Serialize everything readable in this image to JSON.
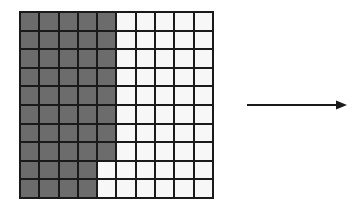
{
  "diagram": {
    "grid": {
      "rows": 10,
      "cols": 10,
      "shaded_count": 48,
      "total_cells": 100,
      "shaded_pattern": "columns 1-4 fully shaded; column 5 shaded in rows 1-8",
      "shaded_color": "#6c6c6c",
      "unshaded_color": "#f7f7f7",
      "line_color": "#1a1a1a",
      "shaded_columns_full": [
        1,
        2,
        3,
        4
      ],
      "partial_column": {
        "col": 5,
        "shaded_rows": [
          1,
          2,
          3,
          4,
          5,
          6,
          7,
          8
        ]
      }
    },
    "arrow": {
      "direction": "right",
      "color": "#1a1a1a"
    }
  }
}
